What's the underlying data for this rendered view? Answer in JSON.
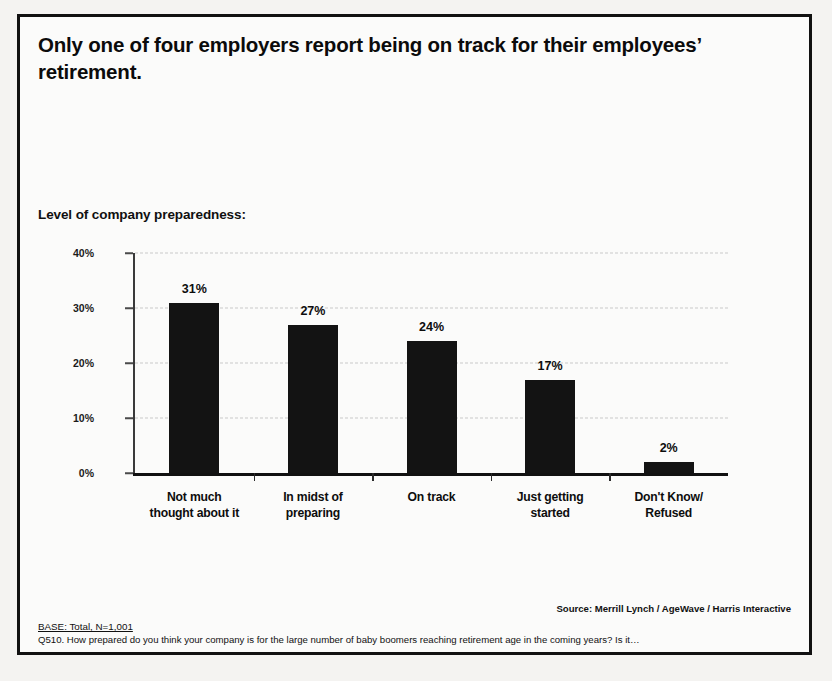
{
  "title": "Only one of four employers report being on track for their employees’ retirement.",
  "subtitle": "Level of company preparedness:",
  "footer": {
    "source": "Source: Merrill Lynch / AgeWave / Harris Interactive",
    "base": "BASE: Total, N=1,001",
    "question": "Q510. How prepared do you think your company is for the large number of baby boomers reaching retirement age in the coming years? Is it…"
  },
  "colors": {
    "bar": "#131313",
    "axis": "#111111",
    "grid": "#c9c9c9",
    "background": "#fbfbfa",
    "border": "#111111"
  },
  "chart_data": {
    "type": "bar",
    "title": "Only one of four employers report being on track for their employees’ retirement.",
    "subtitle": "Level of company preparedness:",
    "categories": [
      "Not much thought about it",
      "In midst of preparing",
      "On track",
      "Just getting started",
      "Don't Know/ Refused"
    ],
    "category_lines": [
      [
        "Not much",
        "thought about it"
      ],
      [
        "In midst of",
        "preparing"
      ],
      [
        "On track",
        ""
      ],
      [
        "Just getting",
        "started"
      ],
      [
        "Don't Know/",
        "Refused"
      ]
    ],
    "values": [
      31,
      27,
      24,
      17,
      2
    ],
    "data_labels": [
      "31%",
      "27%",
      "24%",
      "17%",
      "2%"
    ],
    "xlabel": "",
    "ylabel": "",
    "ylim": [
      0,
      40
    ],
    "yticks": [
      0,
      10,
      20,
      30,
      40
    ],
    "ytick_labels": [
      "0%",
      "10%",
      "20%",
      "30%",
      "40%"
    ],
    "grid": true,
    "grid_style": "dashed-horizontal",
    "legend": false,
    "units": "percent"
  }
}
